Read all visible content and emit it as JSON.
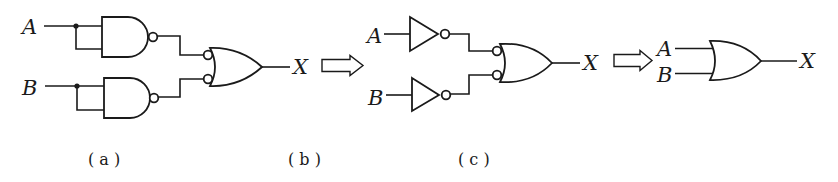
{
  "figure": {
    "panels": [
      {
        "id": "a",
        "caption": "(a)",
        "inputs": [
          "A",
          "B"
        ],
        "output": "X",
        "gates": [
          "NAND (inputs tied, acting as inverter) on A",
          "NAND (inputs tied, acting as inverter) on B",
          "OR with inverted inputs"
        ]
      },
      {
        "id": "b",
        "caption": "(b)",
        "inputs": [
          "A",
          "B"
        ],
        "output": "X",
        "gates": [
          "NOT on A",
          "NOT on B",
          "OR with inverted inputs"
        ]
      },
      {
        "id": "c",
        "caption": "(c)",
        "inputs": [
          "A",
          "B"
        ],
        "output": "X",
        "gates": [
          "OR"
        ]
      }
    ],
    "labels": {
      "a_in_A": "A",
      "a_in_B": "B",
      "a_out": "X",
      "b_in_A": "A",
      "b_in_B": "B",
      "b_out": "X",
      "c_in_A": "A",
      "c_in_B": "B",
      "c_out": "X",
      "cap_a": "( a )",
      "cap_b": "( b )",
      "cap_c": "( c )"
    },
    "colors": {
      "stroke": "#1a1a1a",
      "background": "#ffffff"
    }
  }
}
